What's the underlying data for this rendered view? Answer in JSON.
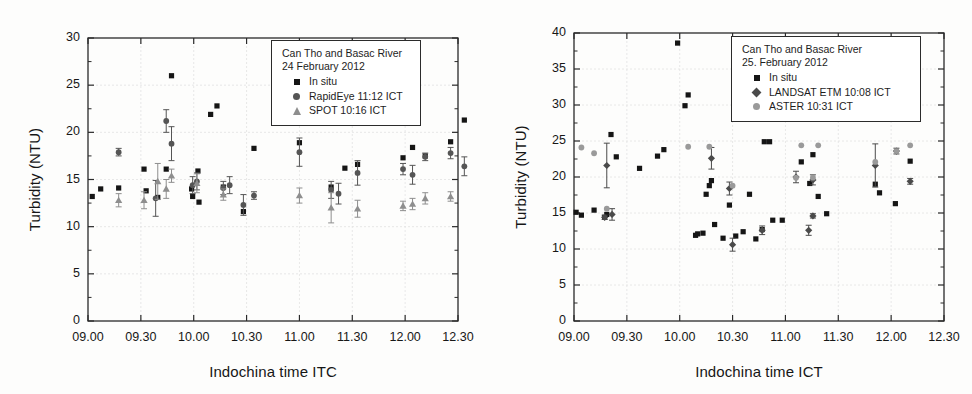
{
  "figure": {
    "panels": [
      "left",
      "right"
    ]
  },
  "chart_data": [
    {
      "type": "scatter",
      "panel": "left",
      "title": "",
      "xlabel": "Indochina time ITC",
      "ylabel": "Turbidity (NTU)",
      "xtick_labels": [
        "09.00",
        "09.30",
        "10.00",
        "10.30",
        "11.00",
        "11.30",
        "12.00",
        "12.30"
      ],
      "xtick_values": [
        9.0,
        9.5,
        10.0,
        10.5,
        11.0,
        11.5,
        12.0,
        12.5
      ],
      "ytick_labels": [
        "0",
        "5",
        "10",
        "15",
        "20",
        "25",
        "30"
      ],
      "ytick_values": [
        0,
        5,
        10,
        15,
        20,
        25,
        30
      ],
      "xlim": [
        9.0,
        12.5
      ],
      "ylim": [
        0,
        30
      ],
      "grid": true,
      "minor_ticks": true,
      "legend_position": "top-right",
      "legend": {
        "line1": "Can Tho and Basac River",
        "line2": "24 February 2012",
        "entries": [
          {
            "label": "In situ",
            "symbol": "square",
            "color": "#151515"
          },
          {
            "label": "RapidEye 11:12 ICT",
            "symbol": "circle",
            "color": "#555555"
          },
          {
            "label": "SPOT 10:16 ICT",
            "symbol": "triangle",
            "color": "#8e8e8e"
          }
        ]
      },
      "series": [
        {
          "name": "In situ",
          "symbol": "square",
          "color": "#151515",
          "points": [
            {
              "x": 9.04,
              "y": 13.2
            },
            {
              "x": 9.12,
              "y": 14.0
            },
            {
              "x": 9.29,
              "y": 14.1
            },
            {
              "x": 9.53,
              "y": 16.1
            },
            {
              "x": 9.55,
              "y": 13.8
            },
            {
              "x": 9.66,
              "y": 13.1
            },
            {
              "x": 9.74,
              "y": 16.1
            },
            {
              "x": 9.79,
              "y": 26.0
            },
            {
              "x": 9.98,
              "y": 14.0
            },
            {
              "x": 9.99,
              "y": 13.2
            },
            {
              "x": 10.04,
              "y": 15.9
            },
            {
              "x": 10.05,
              "y": 12.6
            },
            {
              "x": 10.16,
              "y": 21.9
            },
            {
              "x": 10.22,
              "y": 22.8
            },
            {
              "x": 10.28,
              "y": 14.2
            },
            {
              "x": 10.47,
              "y": 11.6
            },
            {
              "x": 10.57,
              "y": 18.3
            },
            {
              "x": 11.0,
              "y": 18.9
            },
            {
              "x": 11.3,
              "y": 14.2
            },
            {
              "x": 11.43,
              "y": 16.2
            },
            {
              "x": 11.55,
              "y": 16.6
            },
            {
              "x": 11.98,
              "y": 17.3
            },
            {
              "x": 12.07,
              "y": 18.4
            },
            {
              "x": 12.19,
              "y": 17.5
            },
            {
              "x": 12.43,
              "y": 19.0
            },
            {
              "x": 12.56,
              "y": 21.3
            }
          ]
        },
        {
          "name": "RapidEye 11:12 ICT",
          "symbol": "circle",
          "color": "#555555",
          "points": [
            {
              "x": 9.29,
              "y": 17.9,
              "err": 0.4
            },
            {
              "x": 9.64,
              "y": 13.0,
              "err": 1.9
            },
            {
              "x": 9.74,
              "y": 21.2,
              "err": 1.2
            },
            {
              "x": 9.79,
              "y": 18.8,
              "err": 1.8
            },
            {
              "x": 9.99,
              "y": 14.4,
              "err": 0.9
            },
            {
              "x": 10.03,
              "y": 14.8,
              "err": 0.9
            },
            {
              "x": 10.28,
              "y": 14.1,
              "err": 0.7
            },
            {
              "x": 10.34,
              "y": 14.4,
              "err": 0.9
            },
            {
              "x": 10.47,
              "y": 12.3,
              "err": 1.1
            },
            {
              "x": 10.57,
              "y": 13.3,
              "err": 0.4
            },
            {
              "x": 11.0,
              "y": 17.9,
              "err": 1.5
            },
            {
              "x": 11.3,
              "y": 13.9,
              "err": 0.9
            },
            {
              "x": 11.37,
              "y": 13.5,
              "err": 1.1
            },
            {
              "x": 11.55,
              "y": 15.7,
              "err": 1.3
            },
            {
              "x": 11.98,
              "y": 16.1,
              "err": 0.6
            },
            {
              "x": 12.07,
              "y": 15.5,
              "err": 1.0
            },
            {
              "x": 12.19,
              "y": 17.4,
              "err": 0.4
            },
            {
              "x": 12.43,
              "y": 17.8,
              "err": 0.6
            },
            {
              "x": 12.56,
              "y": 16.4,
              "err": 1.0
            }
          ]
        },
        {
          "name": "SPOT 10:16 ICT",
          "symbol": "triangle",
          "color": "#8e8e8e",
          "points": [
            {
              "x": 9.29,
              "y": 12.8,
              "err": 0.7
            },
            {
              "x": 9.53,
              "y": 12.8,
              "err": 0.9
            },
            {
              "x": 9.66,
              "y": 14.8,
              "err": 1.9
            },
            {
              "x": 9.74,
              "y": 14.0,
              "err": 1.0
            },
            {
              "x": 9.79,
              "y": 15.4,
              "err": 0.7
            },
            {
              "x": 10.03,
              "y": 14.6,
              "err": 1.0
            },
            {
              "x": 10.28,
              "y": 13.4,
              "err": 0.6
            },
            {
              "x": 11.0,
              "y": 13.3,
              "err": 0.8
            },
            {
              "x": 11.3,
              "y": 12.0,
              "err": 1.6
            },
            {
              "x": 11.55,
              "y": 11.9,
              "err": 0.9
            },
            {
              "x": 11.98,
              "y": 12.2,
              "err": 0.5
            },
            {
              "x": 12.07,
              "y": 12.4,
              "err": 0.6
            },
            {
              "x": 12.19,
              "y": 13.0,
              "err": 0.6
            },
            {
              "x": 12.43,
              "y": 13.2,
              "err": 0.5
            }
          ]
        }
      ]
    },
    {
      "type": "scatter",
      "panel": "right",
      "title": "",
      "xlabel": "Indochina time ICT",
      "ylabel": "Turbidity (NTU)",
      "xtick_labels": [
        "09.00",
        "09.30",
        "10.00",
        "10.30",
        "11.00",
        "11.30",
        "12.00",
        "12.30"
      ],
      "xtick_values": [
        9.0,
        9.5,
        10.0,
        10.5,
        11.0,
        11.5,
        12.0,
        12.5
      ],
      "ytick_labels": [
        "0",
        "5",
        "10",
        "15",
        "20",
        "25",
        "30",
        "35",
        "40"
      ],
      "ytick_values": [
        0,
        5,
        10,
        15,
        20,
        25,
        30,
        35,
        40
      ],
      "xlim": [
        9.0,
        12.5
      ],
      "ylim": [
        0,
        40
      ],
      "grid": true,
      "minor_ticks": true,
      "legend_position": "top-right",
      "legend": {
        "line1": "Can Tho and Basac River",
        "line2": "25. February 2012",
        "entries": [
          {
            "label": "In situ",
            "symbol": "square",
            "color": "#151515"
          },
          {
            "label": "LANDSAT ETM 10:08 ICT",
            "symbol": "diamond",
            "color": "#4a4a4a"
          },
          {
            "label": "ASTER 10:31 ICT",
            "symbol": "circle-light",
            "color": "#9a9a9a"
          }
        ]
      },
      "series": [
        {
          "name": "In situ",
          "symbol": "square",
          "color": "#151515",
          "points": [
            {
              "x": 9.02,
              "y": 15.1
            },
            {
              "x": 9.07,
              "y": 14.7
            },
            {
              "x": 9.19,
              "y": 15.4
            },
            {
              "x": 9.29,
              "y": 14.4
            },
            {
              "x": 9.31,
              "y": 14.8
            },
            {
              "x": 9.35,
              "y": 25.9
            },
            {
              "x": 9.4,
              "y": 22.8
            },
            {
              "x": 9.62,
              "y": 21.2
            },
            {
              "x": 9.79,
              "y": 22.9
            },
            {
              "x": 9.85,
              "y": 23.8
            },
            {
              "x": 9.98,
              "y": 38.6
            },
            {
              "x": 10.05,
              "y": 29.9
            },
            {
              "x": 10.08,
              "y": 31.4
            },
            {
              "x": 10.15,
              "y": 11.9
            },
            {
              "x": 10.17,
              "y": 12.1
            },
            {
              "x": 10.22,
              "y": 12.2
            },
            {
              "x": 10.25,
              "y": 17.6
            },
            {
              "x": 10.28,
              "y": 18.8
            },
            {
              "x": 10.3,
              "y": 19.5
            },
            {
              "x": 10.33,
              "y": 13.4
            },
            {
              "x": 10.41,
              "y": 11.5
            },
            {
              "x": 10.47,
              "y": 16.1
            },
            {
              "x": 10.53,
              "y": 11.8
            },
            {
              "x": 10.6,
              "y": 12.4
            },
            {
              "x": 10.66,
              "y": 17.6
            },
            {
              "x": 10.72,
              "y": 11.4
            },
            {
              "x": 10.78,
              "y": 12.7
            },
            {
              "x": 10.8,
              "y": 24.9
            },
            {
              "x": 10.85,
              "y": 24.9
            },
            {
              "x": 10.88,
              "y": 14.0
            },
            {
              "x": 10.97,
              "y": 14.0
            },
            {
              "x": 11.15,
              "y": 22.1
            },
            {
              "x": 11.23,
              "y": 19.1
            },
            {
              "x": 11.26,
              "y": 23.1
            },
            {
              "x": 11.31,
              "y": 17.3
            },
            {
              "x": 11.39,
              "y": 14.9
            },
            {
              "x": 11.85,
              "y": 19.0
            },
            {
              "x": 11.89,
              "y": 17.8
            },
            {
              "x": 12.04,
              "y": 16.3
            },
            {
              "x": 12.18,
              "y": 22.2
            }
          ]
        },
        {
          "name": "LANDSAT ETM 10:08 ICT",
          "symbol": "diamond",
          "color": "#4a4a4a",
          "points": [
            {
              "x": 9.29,
              "y": 14.4,
              "err": 0.3
            },
            {
              "x": 9.31,
              "y": 21.6,
              "err": 3.1
            },
            {
              "x": 9.36,
              "y": 14.8,
              "err": 0.8
            },
            {
              "x": 10.3,
              "y": 22.6,
              "err": 1.5
            },
            {
              "x": 10.47,
              "y": 18.4,
              "err": 0.9
            },
            {
              "x": 10.5,
              "y": 10.6,
              "err": 0.9
            },
            {
              "x": 10.78,
              "y": 12.6,
              "err": 0.6
            },
            {
              "x": 11.1,
              "y": 20.0,
              "err": 0.8
            },
            {
              "x": 11.26,
              "y": 19.6,
              "err": 0.7
            },
            {
              "x": 11.26,
              "y": 14.6,
              "err": 0.3
            },
            {
              "x": 11.22,
              "y": 12.6,
              "err": 0.7
            },
            {
              "x": 11.85,
              "y": 21.6,
              "err": 3.0
            },
            {
              "x": 12.05,
              "y": 23.6,
              "err": 0.4
            },
            {
              "x": 12.18,
              "y": 19.4,
              "err": 0.4
            }
          ]
        },
        {
          "name": "ASTER 10:31 ICT",
          "symbol": "circle-light",
          "color": "#9a9a9a",
          "points": [
            {
              "x": 9.07,
              "y": 24.1
            },
            {
              "x": 9.19,
              "y": 23.3
            },
            {
              "x": 9.31,
              "y": 15.6
            },
            {
              "x": 10.08,
              "y": 24.2
            },
            {
              "x": 10.28,
              "y": 24.2
            },
            {
              "x": 10.5,
              "y": 18.8
            },
            {
              "x": 11.1,
              "y": 19.9
            },
            {
              "x": 11.15,
              "y": 24.4
            },
            {
              "x": 11.26,
              "y": 19.9
            },
            {
              "x": 11.31,
              "y": 24.4
            },
            {
              "x": 11.85,
              "y": 22.1
            },
            {
              "x": 12.05,
              "y": 23.6
            },
            {
              "x": 12.18,
              "y": 24.4
            }
          ]
        }
      ]
    }
  ]
}
